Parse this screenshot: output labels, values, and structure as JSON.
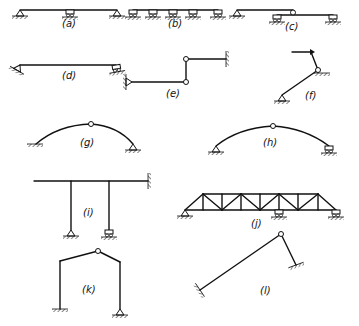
{
  "figure": {
    "labels": {
      "a": "(a)",
      "b": "(b)",
      "c": "(c)",
      "d": "(d)",
      "e": "(e)",
      "f": "(f)",
      "g": "(g)",
      "h": "(h)",
      "i": "(i)",
      "j": "(j)",
      "k": "(k)",
      "l": "(l)"
    },
    "colors": {
      "line": "#111111",
      "background": "#ffffff"
    }
  }
}
